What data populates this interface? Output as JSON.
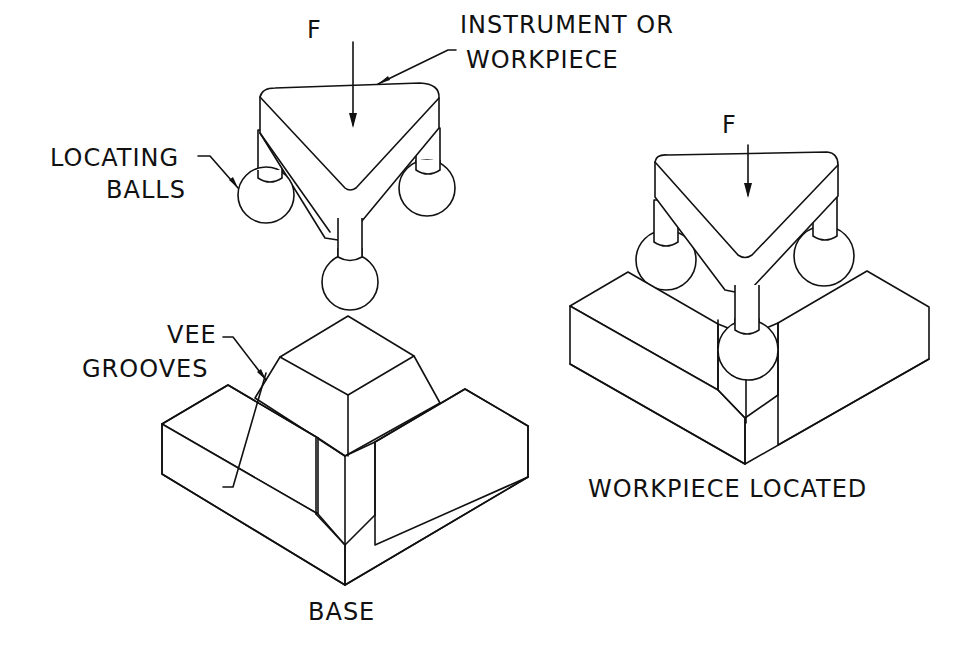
{
  "diagram": {
    "left_assembly": {
      "force_label": "F",
      "instrument_label_line1": "INSTRUMENT OR",
      "instrument_label_line2": "WORKPIECE",
      "balls_label_line1": "LOCATING",
      "balls_label_line2": "BALLS",
      "grooves_label_line1": "VEE",
      "grooves_label_line2": "GROOVES",
      "base_label": "BASE"
    },
    "right_assembly": {
      "force_label": "F",
      "caption": "WORKPIECE LOCATED"
    },
    "colors": {
      "line": "#111111",
      "background": "#ffffff"
    }
  }
}
